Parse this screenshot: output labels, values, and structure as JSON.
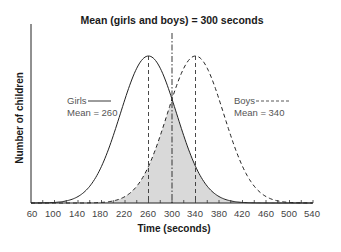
{
  "chart_data": {
    "type": "line",
    "title": "Mean (girls and boys) = 300 seconds",
    "xlabel": "Time (seconds)",
    "ylabel": "Number of children",
    "x_ticks": [
      60,
      100,
      140,
      180,
      220,
      260,
      300,
      340,
      380,
      420,
      460,
      500,
      540
    ],
    "xlim": [
      60,
      540
    ],
    "grid": false,
    "legend_position": "inline",
    "series": [
      {
        "name": "Girls",
        "line_style": "solid",
        "mean": 260,
        "label_text": "Girls",
        "mean_text": "Mean = 260",
        "x": [
          60,
          100,
          140,
          180,
          220,
          260,
          300,
          340,
          380,
          420,
          460
        ],
        "values": [
          0.0,
          0.02,
          0.11,
          0.41,
          0.8,
          1.0,
          0.8,
          0.41,
          0.11,
          0.02,
          0.0
        ]
      },
      {
        "name": "Boys",
        "line_style": "dashed",
        "mean": 340,
        "label_text": "Boys",
        "mean_text": "Mean = 340",
        "x": [
          140,
          180,
          220,
          260,
          300,
          340,
          380,
          420,
          460,
          500,
          540
        ],
        "values": [
          0.0,
          0.02,
          0.11,
          0.41,
          0.8,
          1.0,
          0.8,
          0.41,
          0.11,
          0.02,
          0.0
        ]
      }
    ],
    "annotations": [
      {
        "type": "vline",
        "x": 300,
        "style": "dash-dot",
        "label": "Mean (girls and boys) = 300 seconds"
      },
      {
        "type": "vline",
        "x": 260,
        "style": "dashed",
        "label": "Girls mean"
      },
      {
        "type": "vline",
        "x": 340,
        "style": "dashed",
        "label": "Boys mean"
      },
      {
        "type": "shaded_overlap",
        "description": "Overlap area under both curves shaded gray"
      }
    ]
  },
  "chart": {
    "title": "Mean (girls and boys) = 300 seconds",
    "xlabel": "Time (seconds)",
    "ylabel": "Number of children",
    "ticks": [
      "60",
      "100",
      "140",
      "180",
      "220",
      "260",
      "300",
      "340",
      "380",
      "420",
      "460",
      "500",
      "540"
    ],
    "legend": {
      "girls_label": "Girls",
      "girls_mean": "Mean = 260",
      "boys_label": "Boys",
      "boys_mean": "Mean = 340"
    },
    "colors": {
      "line": "#222222",
      "shade": "#d9d9d9",
      "text": "#444444"
    }
  }
}
